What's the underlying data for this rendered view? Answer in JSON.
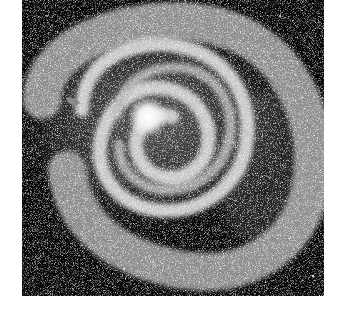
{
  "image": {
    "alt": "Spiral galaxy with bright core and tightly wound arms on black background",
    "subject": "spiral-galaxy",
    "background_color": "#050505",
    "core_color": "#ffffff",
    "arm_color": "#bdbdbd",
    "marker": {
      "shape": "arrow",
      "color": "#8a8a8a"
    }
  }
}
